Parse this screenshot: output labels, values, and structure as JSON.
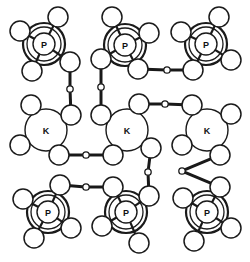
{
  "figure": {
    "background_color": "#ffffff",
    "line_color": "#1a1a1a",
    "atom_fill": "#ffffff",
    "width": 250,
    "height": 262
  },
  "legend": {
    "phosphorus_label": "P",
    "potassium_label": "K"
  },
  "atom_styles": {
    "phosphorus": {
      "label": "P",
      "radius": 11,
      "rings": [
        17,
        21
      ],
      "ring_widths": [
        1.3,
        2.2
      ],
      "core_width": 1.4,
      "font_size": 9
    },
    "potassium": {
      "label": "K",
      "radius": 21,
      "core_width": 1.4,
      "font_size": 9
    },
    "oxygen": {
      "label": "",
      "radius": 10,
      "core_width": 1.5
    },
    "bridge": {
      "label": "",
      "radius": 3.2,
      "core_width": 1.3
    }
  },
  "bond_style": {
    "outer_width": 3.0,
    "inner_width": 1.2,
    "inner_color": "#ffffff"
  },
  "atoms": [
    {
      "id": "P1",
      "kind": "phosphorus",
      "label": "P",
      "x": 44,
      "y": 44
    },
    {
      "id": "P2",
      "kind": "phosphorus",
      "label": "P",
      "x": 125,
      "y": 45
    },
    {
      "id": "P3",
      "kind": "phosphorus",
      "label": "P",
      "x": 206,
      "y": 44
    },
    {
      "id": "P4",
      "kind": "phosphorus",
      "label": "P",
      "x": 48,
      "y": 212
    },
    {
      "id": "P5",
      "kind": "phosphorus",
      "label": "P",
      "x": 126,
      "y": 212
    },
    {
      "id": "P6",
      "kind": "phosphorus",
      "label": "P",
      "x": 207,
      "y": 212
    },
    {
      "id": "K1",
      "kind": "potassium",
      "label": "K",
      "x": 46,
      "y": 130
    },
    {
      "id": "K2",
      "kind": "potassium",
      "label": "K",
      "x": 127,
      "y": 130
    },
    {
      "id": "K3",
      "kind": "potassium",
      "label": "K",
      "x": 207,
      "y": 130
    },
    {
      "id": "O1a",
      "kind": "oxygen",
      "label": "",
      "x": 20,
      "y": 31
    },
    {
      "id": "O1b",
      "kind": "oxygen",
      "label": "",
      "x": 58,
      "y": 17
    },
    {
      "id": "O1c",
      "kind": "oxygen",
      "label": "",
      "x": 32,
      "y": 71
    },
    {
      "id": "O1d",
      "kind": "oxygen",
      "label": "",
      "x": 70,
      "y": 62
    },
    {
      "id": "O2a",
      "kind": "oxygen",
      "label": "",
      "x": 112,
      "y": 17
    },
    {
      "id": "O2b",
      "kind": "oxygen",
      "label": "",
      "x": 149,
      "y": 33
    },
    {
      "id": "O2c",
      "kind": "oxygen",
      "label": "",
      "x": 101,
      "y": 59
    },
    {
      "id": "O2d",
      "kind": "oxygen",
      "label": "",
      "x": 138,
      "y": 69
    },
    {
      "id": "O3a",
      "kind": "oxygen",
      "label": "",
      "x": 181,
      "y": 32
    },
    {
      "id": "O3b",
      "kind": "oxygen",
      "label": "",
      "x": 219,
      "y": 17
    },
    {
      "id": "O3c",
      "kind": "oxygen",
      "label": "",
      "x": 193,
      "y": 70
    },
    {
      "id": "O3d",
      "kind": "oxygen",
      "label": "",
      "x": 231,
      "y": 60
    },
    {
      "id": "O4a",
      "kind": "oxygen",
      "label": "",
      "x": 23,
      "y": 199
    },
    {
      "id": "O4b",
      "kind": "oxygen",
      "label": "",
      "x": 60,
      "y": 185
    },
    {
      "id": "O4c",
      "kind": "oxygen",
      "label": "",
      "x": 34,
      "y": 238
    },
    {
      "id": "O4d",
      "kind": "oxygen",
      "label": "",
      "x": 71,
      "y": 228
    },
    {
      "id": "O5a",
      "kind": "oxygen",
      "label": "",
      "x": 102,
      "y": 226
    },
    {
      "id": "O5b",
      "kind": "oxygen",
      "label": "",
      "x": 113,
      "y": 187
    },
    {
      "id": "O5c",
      "kind": "oxygen",
      "label": "",
      "x": 139,
      "y": 243
    },
    {
      "id": "O5d",
      "kind": "oxygen",
      "label": "",
      "x": 149,
      "y": 196
    },
    {
      "id": "O6a",
      "kind": "oxygen",
      "label": "",
      "x": 183,
      "y": 198
    },
    {
      "id": "O6b",
      "kind": "oxygen",
      "label": "",
      "x": 220,
      "y": 187
    },
    {
      "id": "O6c",
      "kind": "oxygen",
      "label": "",
      "x": 194,
      "y": 241
    },
    {
      "id": "O6d",
      "kind": "oxygen",
      "label": "",
      "x": 231,
      "y": 228
    },
    {
      "id": "OK1a",
      "kind": "oxygen",
      "label": "",
      "x": 31,
      "y": 105
    },
    {
      "id": "OK1b",
      "kind": "oxygen",
      "label": "",
      "x": 20,
      "y": 145
    },
    {
      "id": "OK1c",
      "kind": "oxygen",
      "label": "",
      "x": 59,
      "y": 155
    },
    {
      "id": "OK1d",
      "kind": "oxygen",
      "label": "",
      "x": 71,
      "y": 115
    },
    {
      "id": "OK2a",
      "kind": "oxygen",
      "label": "",
      "x": 139,
      "y": 104
    },
    {
      "id": "OK2b",
      "kind": "oxygen",
      "label": "",
      "x": 101,
      "y": 115
    },
    {
      "id": "OK2c",
      "kind": "oxygen",
      "label": "",
      "x": 113,
      "y": 155
    },
    {
      "id": "OK2d",
      "kind": "oxygen",
      "label": "",
      "x": 151,
      "y": 148
    },
    {
      "id": "OK3a",
      "kind": "oxygen",
      "label": "",
      "x": 192,
      "y": 105
    },
    {
      "id": "OK3b",
      "kind": "oxygen",
      "label": "",
      "x": 231,
      "y": 114
    },
    {
      "id": "OK3c",
      "kind": "oxygen",
      "label": "",
      "x": 182,
      "y": 145
    },
    {
      "id": "OK3d",
      "kind": "oxygen",
      "label": "",
      "x": 220,
      "y": 155
    },
    {
      "id": "B1",
      "kind": "bridge",
      "label": "",
      "x": 70,
      "y": 89
    },
    {
      "id": "B2",
      "kind": "bridge",
      "label": "",
      "x": 101,
      "y": 87
    },
    {
      "id": "B3",
      "kind": "bridge",
      "label": "",
      "x": 167,
      "y": 70
    },
    {
      "id": "B4",
      "kind": "bridge",
      "label": "",
      "x": 165,
      "y": 104
    },
    {
      "id": "B5",
      "kind": "bridge",
      "label": "",
      "x": 86,
      "y": 155
    },
    {
      "id": "B6",
      "kind": "bridge",
      "label": "",
      "x": 148,
      "y": 172
    },
    {
      "id": "B7",
      "kind": "bridge",
      "label": "",
      "x": 182,
      "y": 171
    },
    {
      "id": "B8",
      "kind": "bridge",
      "label": "",
      "x": 86,
      "y": 187
    }
  ],
  "bonds": [
    {
      "from": "P1",
      "to": "O1a",
      "style": "single"
    },
    {
      "from": "P1",
      "to": "O1b",
      "style": "single"
    },
    {
      "from": "P1",
      "to": "O1c",
      "style": "single"
    },
    {
      "from": "P1",
      "to": "O1d",
      "style": "single"
    },
    {
      "from": "P2",
      "to": "O2a",
      "style": "single"
    },
    {
      "from": "P2",
      "to": "O2b",
      "style": "single"
    },
    {
      "from": "P2",
      "to": "O2c",
      "style": "single"
    },
    {
      "from": "P2",
      "to": "O2d",
      "style": "single"
    },
    {
      "from": "P3",
      "to": "O3a",
      "style": "single"
    },
    {
      "from": "P3",
      "to": "O3b",
      "style": "single"
    },
    {
      "from": "P3",
      "to": "O3c",
      "style": "single"
    },
    {
      "from": "P3",
      "to": "O3d",
      "style": "single"
    },
    {
      "from": "P4",
      "to": "O4a",
      "style": "single"
    },
    {
      "from": "P4",
      "to": "O4b",
      "style": "single"
    },
    {
      "from": "P4",
      "to": "O4c",
      "style": "single"
    },
    {
      "from": "P4",
      "to": "O4d",
      "style": "single"
    },
    {
      "from": "P5",
      "to": "O5a",
      "style": "single"
    },
    {
      "from": "P5",
      "to": "O5b",
      "style": "single"
    },
    {
      "from": "P5",
      "to": "O5c",
      "style": "single"
    },
    {
      "from": "P5",
      "to": "O5d",
      "style": "single"
    },
    {
      "from": "P6",
      "to": "O6a",
      "style": "single"
    },
    {
      "from": "P6",
      "to": "O6b",
      "style": "single"
    },
    {
      "from": "P6",
      "to": "O6c",
      "style": "single"
    },
    {
      "from": "P6",
      "to": "O6d",
      "style": "single"
    },
    {
      "from": "K1",
      "to": "OK1a",
      "style": "single"
    },
    {
      "from": "K1",
      "to": "OK1b",
      "style": "single"
    },
    {
      "from": "K1",
      "to": "OK1c",
      "style": "single"
    },
    {
      "from": "K1",
      "to": "OK1d",
      "style": "single"
    },
    {
      "from": "K2",
      "to": "OK2a",
      "style": "single"
    },
    {
      "from": "K2",
      "to": "OK2b",
      "style": "single"
    },
    {
      "from": "K2",
      "to": "OK2c",
      "style": "single"
    },
    {
      "from": "K2",
      "to": "OK2d",
      "style": "single"
    },
    {
      "from": "K3",
      "to": "OK3a",
      "style": "single"
    },
    {
      "from": "K3",
      "to": "OK3b",
      "style": "single"
    },
    {
      "from": "K3",
      "to": "OK3c",
      "style": "single"
    },
    {
      "from": "K3",
      "to": "OK3d",
      "style": "single"
    },
    {
      "from": "O1d",
      "to": "B1",
      "style": "double"
    },
    {
      "from": "B1",
      "to": "OK1d",
      "style": "double"
    },
    {
      "from": "O2c",
      "to": "B2",
      "style": "double"
    },
    {
      "from": "B2",
      "to": "OK2b",
      "style": "double"
    },
    {
      "from": "O2d",
      "to": "B3",
      "style": "double"
    },
    {
      "from": "B3",
      "to": "O3c",
      "style": "double"
    },
    {
      "from": "OK2a",
      "to": "B4",
      "style": "double"
    },
    {
      "from": "B4",
      "to": "OK3a",
      "style": "double"
    },
    {
      "from": "OK1c",
      "to": "B5",
      "style": "double"
    },
    {
      "from": "B5",
      "to": "OK2c",
      "style": "double"
    },
    {
      "from": "OK2d",
      "to": "B6",
      "style": "double"
    },
    {
      "from": "B6",
      "to": "O5d",
      "style": "double"
    },
    {
      "from": "OK3d",
      "to": "B7",
      "style": "double"
    },
    {
      "from": "B7",
      "to": "O6b",
      "style": "double"
    },
    {
      "from": "O4b",
      "to": "B8",
      "style": "double"
    },
    {
      "from": "B8",
      "to": "O5b",
      "style": "double"
    }
  ]
}
